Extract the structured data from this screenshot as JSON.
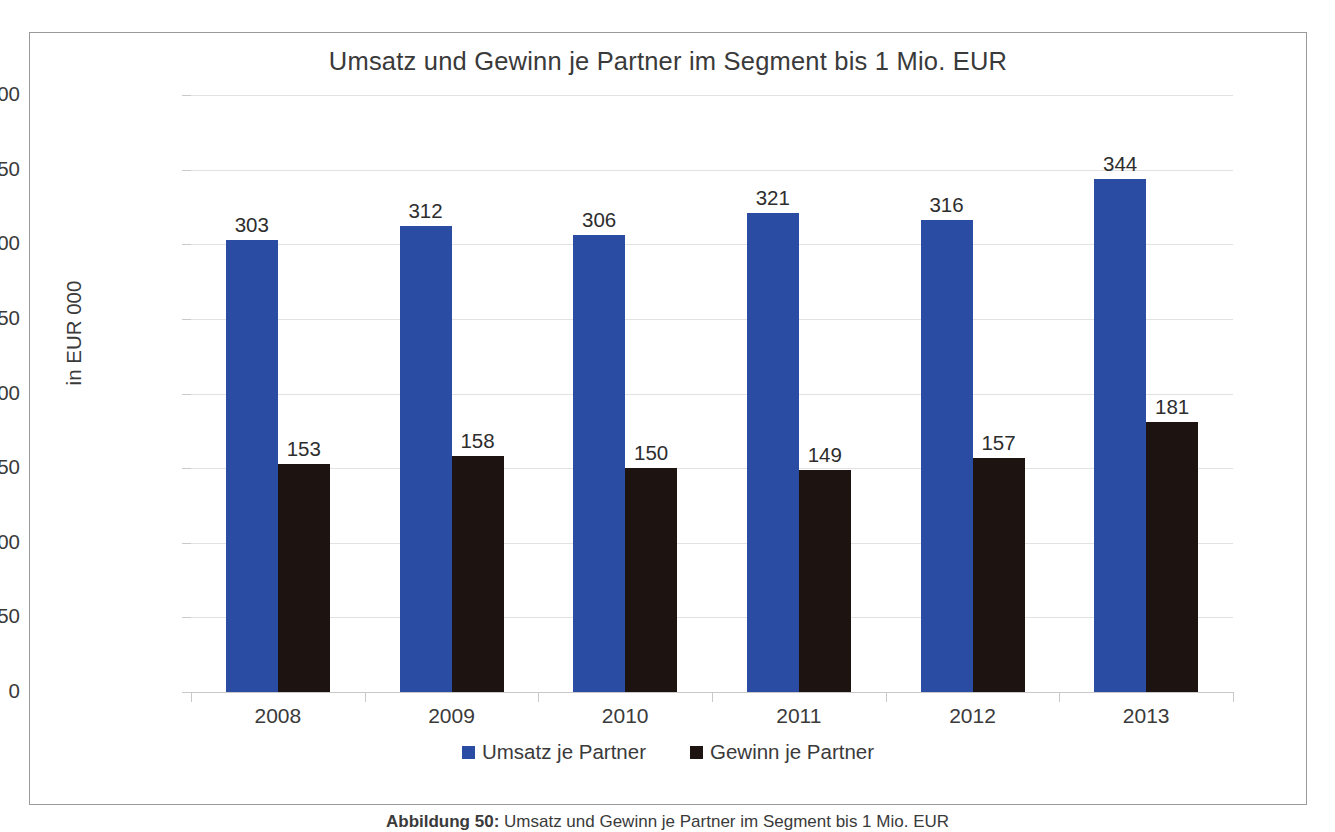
{
  "chart_data": {
    "type": "bar",
    "title": "Umsatz und Gewinn je Partner im Segment bis 1 Mio. EUR",
    "xlabel": "",
    "ylabel": "in EUR 000",
    "ylim": [
      0,
      400
    ],
    "ytick_step": 50,
    "yticks": [
      "400",
      "350",
      "300",
      "250",
      "200",
      "150",
      "100",
      "50",
      "0"
    ],
    "grid": true,
    "legend_position": "bottom",
    "categories": [
      "2008",
      "2009",
      "2010",
      "2011",
      "2012",
      "2013"
    ],
    "series": [
      {
        "name": "Umsatz je Partner",
        "color": "#2a4da3",
        "values": [
          303,
          312,
          306,
          321,
          316,
          344
        ],
        "labels": [
          "303",
          "312",
          "306",
          "321",
          "316",
          "344"
        ]
      },
      {
        "name": "Gewinn je Partner",
        "color": "#1d1310",
        "values": [
          153,
          158,
          150,
          149,
          157,
          181
        ],
        "labels": [
          "153",
          "158",
          "150",
          "149",
          "157",
          "181"
        ]
      }
    ]
  },
  "caption": {
    "prefix": "Abbildung 50:",
    "rest": " Umsatz und Gewinn je Partner im Segment bis 1 Mio. EUR"
  }
}
